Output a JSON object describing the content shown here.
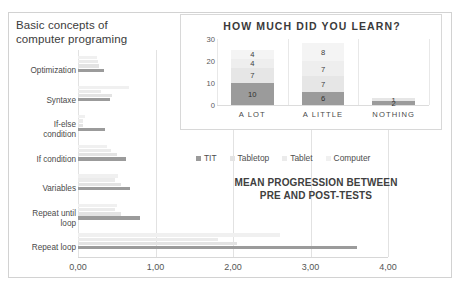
{
  "main_chart": {
    "title": "Basic concepts of\ncomputer programing",
    "title_line1": "Basic concepts of",
    "title_line2": "computer programing",
    "subtitle_line1": "MEAN PROGRESSION BETWEEN",
    "subtitle_line2": "PRE AND POST-TESTS",
    "legend": [
      {
        "label": "TIT",
        "color": "#9b9b9b"
      },
      {
        "label": "Tabletop",
        "color": "#e3e3e3"
      },
      {
        "label": "Tablet",
        "color": "#ebebeb"
      },
      {
        "label": "Computer",
        "color": "#f0f0f0"
      }
    ]
  },
  "inset_chart": {
    "title": "HOW MUCH DID YOU LEARN?"
  },
  "chart_data": [
    {
      "type": "bar",
      "orientation": "horizontal",
      "title": "Basic concepts of computer programing",
      "subtitle": "MEAN PROGRESSION BETWEEN PRE AND POST-TESTS",
      "xlabel": "",
      "ylabel": "",
      "xlim": [
        0,
        4
      ],
      "xticks": [
        "0,00",
        "1,00",
        "2,00",
        "3,00",
        "4,00"
      ],
      "xtick_values": [
        0,
        1,
        2,
        3,
        4
      ],
      "grid": true,
      "legend_position": "center",
      "categories": [
        "Optimization",
        "Syntaxe",
        "If-else condition",
        "If condition",
        "Variables",
        "Repeat until loop",
        "Repeat loop"
      ],
      "series": [
        {
          "name": "TIT",
          "color": "#9b9b9b",
          "values": [
            0.33,
            0.41,
            0.35,
            0.62,
            0.67,
            0.8,
            3.6
          ]
        },
        {
          "name": "Tabletop",
          "color": "#e3e3e3",
          "values": [
            0.27,
            0.44,
            0.07,
            0.5,
            0.55,
            0.56,
            2.05
          ]
        },
        {
          "name": "Tablet",
          "color": "#ebebeb",
          "values": [
            0.26,
            0.3,
            0.06,
            0.42,
            0.48,
            0.48,
            1.8
          ]
        },
        {
          "name": "Computer",
          "color": "#f0f0f0",
          "values": [
            0.24,
            0.66,
            0.09,
            0.38,
            0.52,
            0.5,
            2.6
          ]
        }
      ]
    },
    {
      "type": "bar",
      "orientation": "vertical",
      "stacked": true,
      "title": "HOW MUCH DID YOU LEARN?",
      "xlabel": "",
      "ylabel": "",
      "ylim": [
        0,
        30
      ],
      "yticks": [
        "0",
        "10",
        "20",
        "30"
      ],
      "ytick_values": [
        0,
        10,
        20,
        30
      ],
      "grid": true,
      "categories": [
        "A LOT",
        "A LITTLE",
        "NOTHING"
      ],
      "series": [
        {
          "name": "TIT",
          "color": "#9b9b9b",
          "values": [
            10,
            6,
            2
          ]
        },
        {
          "name": "Tabletop",
          "color": "#e6e6e6",
          "values": [
            7,
            7,
            1
          ]
        },
        {
          "name": "Tablet",
          "color": "#eeeeee",
          "values": [
            4,
            7,
            0
          ]
        },
        {
          "name": "Computer",
          "color": "#f4f4f4",
          "values": [
            4,
            8,
            0
          ]
        }
      ],
      "bar_labels": {
        "A LOT": [
          "10",
          "7",
          "4",
          "4"
        ],
        "A LITTLE": [
          "6",
          "7",
          "7",
          "8"
        ],
        "NOTHING": [
          "2",
          "1"
        ]
      }
    }
  ]
}
